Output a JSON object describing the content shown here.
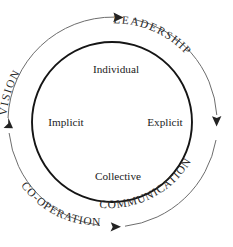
{
  "diagram": {
    "type": "cycle-diagram",
    "title_present": false,
    "colors": {
      "background": "#ffffff",
      "inner_circle_stroke": "#151515",
      "outer_arc_stroke": "#6d6d6d",
      "arrow_fill": "#232323",
      "text": "#1b1b1b"
    },
    "geometry": {
      "center_x": 112,
      "center_y": 122,
      "inner_radius": 80,
      "outer_radius": 105
    },
    "inner_labels": [
      {
        "name": "individual",
        "text": "Individual",
        "position": "top"
      },
      {
        "name": "implicit",
        "text": "Implicit",
        "position": "left"
      },
      {
        "name": "explicit",
        "text": "Explicit",
        "position": "right"
      },
      {
        "name": "collective",
        "text": "Collective",
        "position": "bottom"
      }
    ],
    "ring_labels": [
      {
        "name": "vision",
        "text": "VISION",
        "quadrant": "top-left"
      },
      {
        "name": "leadership",
        "text": "LEADERSHIP",
        "quadrant": "top-right"
      },
      {
        "name": "communication",
        "text": "COMMUNICATION",
        "quadrant": "bottom-right"
      },
      {
        "name": "co-operation",
        "text": "CO-OPERATION",
        "quadrant": "bottom-left"
      }
    ],
    "arrows": [
      {
        "name": "arrow-top",
        "direction": "right",
        "quadrant_end": "top"
      },
      {
        "name": "arrow-right",
        "direction": "down",
        "quadrant_end": "right"
      },
      {
        "name": "arrow-bottom",
        "direction": "left",
        "quadrant_end": "bottom"
      },
      {
        "name": "arrow-left",
        "direction": "up",
        "quadrant_end": "left"
      }
    ]
  }
}
